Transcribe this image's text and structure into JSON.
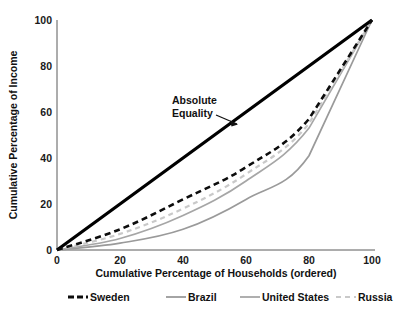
{
  "chart_data": {
    "type": "line",
    "title": "",
    "subtitle": "",
    "xlabel": "Cumulative Percentage of Households (ordered)",
    "ylabel": "Cumulative Percentage of Income",
    "xlim": [
      0,
      100
    ],
    "ylim": [
      0,
      100
    ],
    "xticks": [
      "0",
      "20",
      "40",
      "60",
      "80",
      "100"
    ],
    "yticks": [
      "0",
      "20",
      "40",
      "60",
      "80",
      "100"
    ],
    "xtick_values": [
      0,
      20,
      40,
      60,
      80,
      100
    ],
    "ytick_values": [
      0,
      20,
      40,
      60,
      80,
      100
    ],
    "grid": false,
    "legend_position": "bottom",
    "x": [
      0,
      20,
      40,
      60,
      80,
      100
    ],
    "series": [
      {
        "name": "Absolute Equality",
        "values": [
          0,
          20,
          40,
          60,
          80,
          100
        ],
        "color": "#000000",
        "style": "solid",
        "width": 3.2,
        "in_legend": false
      },
      {
        "name": "Sweden",
        "values": [
          0,
          9,
          22,
          36,
          57,
          100
        ],
        "color": "#0d0d0d",
        "style": "dashed",
        "width": 2.6,
        "in_legend": true
      },
      {
        "name": "Brazil",
        "values": [
          0,
          3,
          9,
          22,
          41,
          100
        ],
        "color": "#9a9a9a",
        "style": "solid",
        "width": 1.7,
        "in_legend": true
      },
      {
        "name": "United States",
        "values": [
          0,
          5,
          15,
          30,
          53,
          100
        ],
        "color": "#a6a6a6",
        "style": "solid",
        "width": 1.7,
        "in_legend": true
      },
      {
        "name": "Russia",
        "values": [
          0,
          7,
          18,
          33,
          55,
          100
        ],
        "color": "#c9c9c9",
        "style": "dashed",
        "width": 2.2,
        "in_legend": true
      }
    ],
    "annotations": [
      {
        "text_line1": "Absolute",
        "text_line2": "Equality",
        "target_x": 55,
        "target_y": 55
      }
    ]
  },
  "axes": {
    "x_title": "Cumulative Percentage of Households (ordered)",
    "y_title": "Cumulative Percentage of Income",
    "x_ticks": [
      "0",
      "20",
      "40",
      "60",
      "80",
      "100"
    ],
    "y_ticks": [
      "0",
      "20",
      "40",
      "60",
      "80",
      "100"
    ]
  },
  "annotation": {
    "line1": "Absolute",
    "line2": "Equality"
  },
  "legend": {
    "items": [
      {
        "label": "Sweden",
        "color": "#0d0d0d",
        "style": "dashed"
      },
      {
        "label": "Brazil",
        "color": "#9a9a9a",
        "style": "solid"
      },
      {
        "label": "United States",
        "color": "#a6a6a6",
        "style": "solid"
      },
      {
        "label": "Russia",
        "color": "#c9c9c9",
        "style": "dashed"
      }
    ]
  }
}
